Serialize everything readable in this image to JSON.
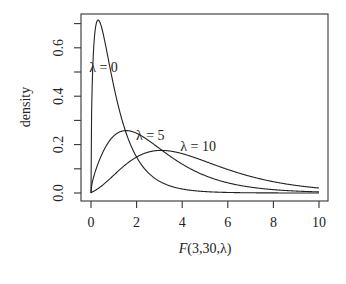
{
  "chart_data": {
    "type": "line",
    "title": "",
    "xlabel": "F(3,30,λ)",
    "ylabel": "density",
    "xlim": [
      0,
      10
    ],
    "ylim": [
      0,
      0.7
    ],
    "grid": false,
    "legend": "none (direct curve labels)",
    "x_ticks": [
      "0",
      "2",
      "4",
      "6",
      "8",
      "10"
    ],
    "y_ticks": [
      "0.0",
      "0.2",
      "0.4",
      "0.6"
    ],
    "y_minor_ticks": [
      0.1,
      0.3,
      0.5,
      0.7
    ],
    "df1": 3,
    "df2": 30,
    "series": [
      {
        "name": "λ = 0",
        "ncp": 0,
        "x": [
          0,
          0.1,
          0.2,
          0.3,
          0.5,
          0.75,
          1,
          1.5,
          2,
          3,
          4,
          6,
          8,
          10
        ],
        "y": [
          0,
          0.55,
          0.69,
          0.71,
          0.65,
          0.52,
          0.4,
          0.22,
          0.12,
          0.04,
          0.013,
          0.002,
          0.0003,
          5e-05
        ]
      },
      {
        "name": "λ = 5",
        "ncp": 5,
        "x": [
          0,
          0.5,
          1,
          1.5,
          2,
          3,
          4,
          5,
          6,
          8,
          10
        ],
        "y": [
          0,
          0.15,
          0.23,
          0.255,
          0.245,
          0.18,
          0.11,
          0.065,
          0.036,
          0.011,
          0.003
        ]
      },
      {
        "name": "λ = 10",
        "ncp": 10,
        "x": [
          0,
          1,
          2,
          3,
          3.5,
          4,
          5,
          6,
          7,
          8,
          10
        ],
        "y": [
          0,
          0.06,
          0.13,
          0.17,
          0.175,
          0.17,
          0.145,
          0.11,
          0.08,
          0.055,
          0.023
        ]
      }
    ],
    "annotations": [
      {
        "text": "λ = 0",
        "x": 0.55,
        "y": 0.5
      },
      {
        "text": "λ = 5",
        "x": 2.6,
        "y": 0.22
      },
      {
        "text": "λ = 10",
        "x": 4.7,
        "y": 0.175
      }
    ]
  }
}
